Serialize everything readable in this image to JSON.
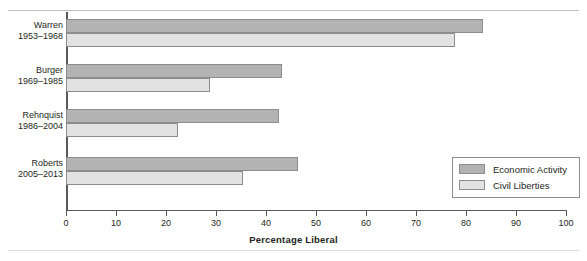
{
  "figure": {
    "caption_fragment": "",
    "xaxis_title": "Percentage Liberal"
  },
  "legend": {
    "items": [
      {
        "label": "Economic Activity",
        "color": "#b3b3b3"
      },
      {
        "label": "Civil Liberties",
        "color": "#e2e2e2"
      }
    ]
  },
  "groups": [
    {
      "name": "Warren",
      "years": "1953–1968"
    },
    {
      "name": "Burger",
      "years": "1969–1985"
    },
    {
      "name": "Rehnquist",
      "years": "1986–2004"
    },
    {
      "name": "Roberts",
      "years": "2005–2013"
    }
  ],
  "axis": {
    "ticks": [
      "0",
      "10",
      "20",
      "30",
      "40",
      "50",
      "60",
      "70",
      "80",
      "90",
      "100"
    ]
  },
  "chart_data": {
    "type": "bar",
    "orientation": "horizontal",
    "title": "",
    "xlabel": "Percentage Liberal",
    "ylabel": "",
    "xlim": [
      0,
      100
    ],
    "xticks": [
      0,
      10,
      20,
      30,
      40,
      50,
      60,
      70,
      80,
      90,
      100
    ],
    "grid": false,
    "legend_position": "lower-right",
    "categories": [
      "Warren 1953–1968",
      "Burger 1969–1985",
      "Rehnquist 1986–2004",
      "Roberts 2005–2013"
    ],
    "series": [
      {
        "name": "Economic Activity",
        "color": "#b3b3b3",
        "values": [
          83.4,
          43.2,
          42.6,
          46.4
        ]
      },
      {
        "name": "Civil Liberties",
        "color": "#e2e2e2",
        "values": [
          77.8,
          28.8,
          22.4,
          35.4
        ]
      }
    ]
  }
}
